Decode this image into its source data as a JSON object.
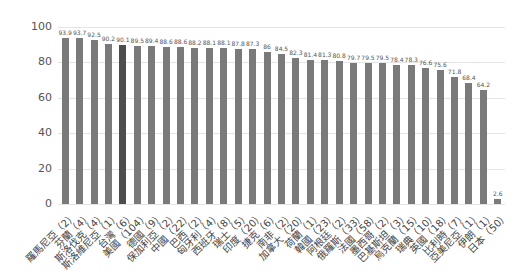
{
  "chart_data": {
    "type": "bar",
    "title": "",
    "xlabel": "",
    "ylabel": "",
    "ylim": [
      0,
      100
    ],
    "yticks": [
      0,
      20,
      40,
      60,
      80,
      100
    ],
    "grid": true,
    "legend": null,
    "bar_color": "#7a7a7a",
    "highlight_color": "#4d4d4d",
    "categories": [
      "羅馬尼亞（2）",
      "芬蘭（4）",
      "斯洛伐克（4）",
      "斯洛維尼亞（1）",
      "台灣（6）",
      "美國（104）",
      "德國（9）",
      "保加利亞（2）",
      "中國（22）",
      "巴西（2）",
      "匈牙利（4）",
      "西班牙（8）",
      "瑞士（5）",
      "印度（20）",
      "捷克（6）",
      "南非（2）",
      "加拿大（20）",
      "荷蘭（1）",
      "韓國（23）",
      "阿根廷（2）",
      "俄羅斯（33）",
      "法國（58）",
      "墨西哥（2）",
      "巴基斯坦（3）",
      "烏克蘭（15）",
      "瑞典（10）",
      "英國（18）",
      "比利時（7）",
      "亞美尼亞（1）",
      "伊朗（1）",
      "日本（50）"
    ],
    "values": [
      93.9,
      93.7,
      92.5,
      90.2,
      90.1,
      89.5,
      89.4,
      88.6,
      88.6,
      88.2,
      88.1,
      88.1,
      87.8,
      87.3,
      86,
      84.5,
      82.3,
      81.4,
      81.3,
      80.8,
      79.7,
      79.5,
      79.5,
      78.4,
      78.3,
      76.6,
      75.6,
      71.8,
      68.4,
      64.2,
      2.6
    ],
    "highlight_index": 4
  }
}
